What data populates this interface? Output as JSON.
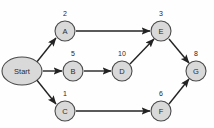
{
  "diagram": {
    "type": "directed-acyclic-graph",
    "title": "",
    "canvas": {
      "width": 214,
      "height": 128,
      "background": "#fefefe"
    },
    "colors": {
      "node_fill": "#d9d9d9",
      "node_stroke": "#4a4a4a",
      "edge": "#232323",
      "text": "#1f1f1f"
    },
    "nodes": [
      {
        "id": "start",
        "label": "Start",
        "weight": null,
        "shape": "ellipse",
        "x": 22,
        "y": 71,
        "rx": 20,
        "ry": 14
      },
      {
        "id": "a",
        "label": "A",
        "weight": "2",
        "shape": "circle",
        "x": 65,
        "y": 31,
        "r": 10
      },
      {
        "id": "b",
        "label": "B",
        "weight": "5",
        "shape": "circle",
        "x": 73,
        "y": 71,
        "r": 10
      },
      {
        "id": "c",
        "label": "C",
        "weight": "1",
        "shape": "circle",
        "x": 65,
        "y": 111,
        "r": 10
      },
      {
        "id": "d",
        "label": "D",
        "weight": "10",
        "shape": "circle",
        "x": 122,
        "y": 71,
        "r": 10
      },
      {
        "id": "e",
        "label": "E",
        "weight": "3",
        "shape": "circle",
        "x": 161,
        "y": 31,
        "r": 10
      },
      {
        "id": "f",
        "label": "F",
        "weight": "6",
        "shape": "circle",
        "x": 161,
        "y": 111,
        "r": 10
      },
      {
        "id": "g",
        "label": "G",
        "weight": "8",
        "shape": "circle",
        "x": 196,
        "y": 71,
        "r": 10
      }
    ],
    "edges": [
      {
        "id": "start-a",
        "from": "Start",
        "to": "A",
        "x1": 36,
        "y1": 63,
        "x2": 56,
        "y2": 38
      },
      {
        "id": "start-b",
        "from": "Start",
        "to": "B",
        "x1": 43,
        "y1": 71,
        "x2": 62,
        "y2": 71
      },
      {
        "id": "start-c",
        "from": "Start",
        "to": "C",
        "x1": 36,
        "y1": 79,
        "x2": 56,
        "y2": 104
      },
      {
        "id": "a-e",
        "from": "A",
        "to": "E",
        "x1": 76,
        "y1": 31,
        "x2": 150,
        "y2": 31
      },
      {
        "id": "b-d",
        "from": "B",
        "to": "D",
        "x1": 84,
        "y1": 71,
        "x2": 111,
        "y2": 71
      },
      {
        "id": "d-e",
        "from": "D",
        "to": "E",
        "x1": 130,
        "y1": 64,
        "x2": 154,
        "y2": 39
      },
      {
        "id": "c-f",
        "from": "C",
        "to": "F",
        "x1": 76,
        "y1": 111,
        "x2": 150,
        "y2": 111
      },
      {
        "id": "e-g",
        "from": "E",
        "to": "G",
        "x1": 169,
        "y1": 39,
        "x2": 189,
        "y2": 63
      },
      {
        "id": "f-g",
        "from": "F",
        "to": "G",
        "x1": 169,
        "y1": 104,
        "x2": 189,
        "y2": 79
      }
    ]
  }
}
